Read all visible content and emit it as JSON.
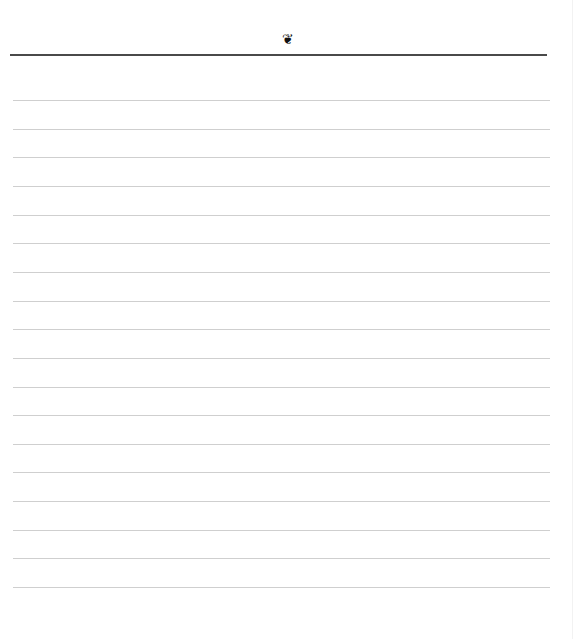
{
  "page": {
    "type": "lined-notepaper",
    "header": {
      "ornament_icon": "fleuron-icon",
      "ornament_glyph": "❦",
      "rule_color": "#4a4a4a"
    },
    "lines": {
      "count": 18,
      "first_y": 100,
      "spacing": 28.65,
      "color": "#cfcfcf",
      "entries": [
        "",
        "",
        "",
        "",
        "",
        "",
        "",
        "",
        "",
        "",
        "",
        "",
        "",
        "",
        "",
        "",
        "",
        ""
      ]
    }
  }
}
